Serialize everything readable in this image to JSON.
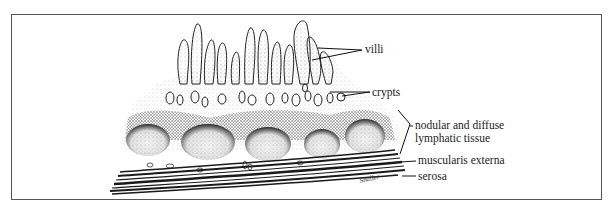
{
  "figure": {
    "top_text_cut": "",
    "labels": {
      "villi": "villi",
      "crypts": "crypts",
      "lymphatic_line1": "nodular and diffuse",
      "lymphatic_line2": "lymphatic tissue",
      "muscularis": "muscularis externa",
      "serosa": "serosa"
    },
    "signature": "Sballer",
    "colors": {
      "ink": "#222222",
      "frame": "#555555",
      "stipple": "#9a9a9a",
      "dark": "#1a1a1a"
    }
  }
}
